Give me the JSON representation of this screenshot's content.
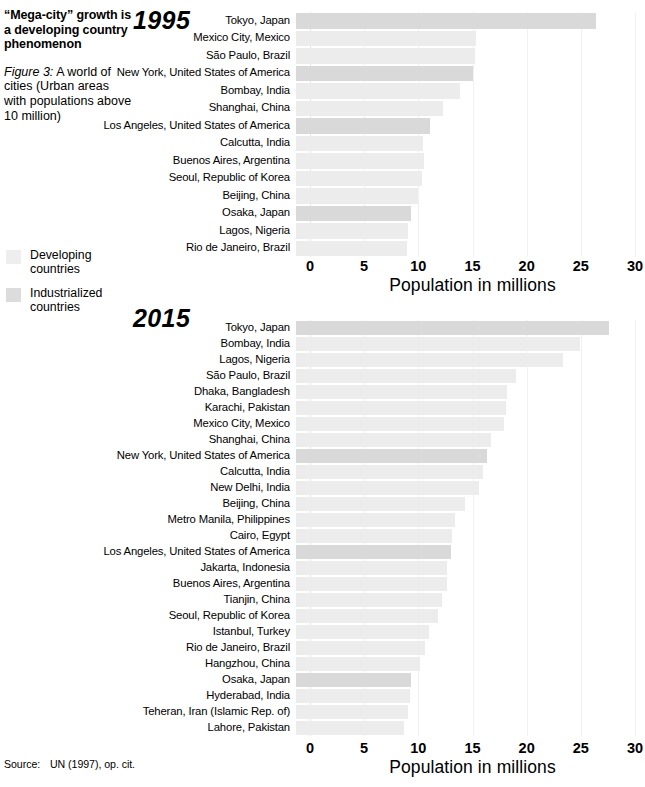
{
  "headline": "“Mega-city” growth is a developing country phenomenon",
  "caption": {
    "figure": "Figure 3:",
    "text": "A world of cities (Urban areas with populations above 10 million)"
  },
  "legend": {
    "items": [
      {
        "label": "Developing countries",
        "key": "developing",
        "color": "#ececec"
      },
      {
        "label": "Industrialized countries",
        "key": "industrialized",
        "color": "#d9d9d9"
      }
    ]
  },
  "source": {
    "label": "Source:",
    "text": "UN (1997), op. cit."
  },
  "axis": {
    "title": "Population in millions",
    "ticks": [
      "0",
      "5",
      "10",
      "15",
      "20",
      "25",
      "30"
    ],
    "min": 0,
    "max": 30
  },
  "chart_data": [
    {
      "type": "bar",
      "orientation": "horizontal",
      "title": "1995",
      "xlabel": "Population in millions",
      "ylabel": "",
      "xlim": [
        0,
        30
      ],
      "xticks": [
        0,
        5,
        10,
        15,
        20,
        25,
        30
      ],
      "grid": true,
      "legend_position": "left-panel",
      "categories": [
        "Tokyo, Japan",
        "Mexico City, Mexico",
        "São Paulo, Brazil",
        "New York, United States of America",
        "Bombay, India",
        "Shanghai, China",
        "Los Angeles, United States of America",
        "Calcutta, India",
        "Buenos Aires, Argentina",
        "Seoul, Republic of Korea",
        "Beijing, China",
        "Osaka, Japan",
        "Lagos, Nigeria",
        "Rio de Janeiro, Brazil"
      ],
      "values": [
        27.7,
        16.6,
        16.5,
        16.3,
        15.1,
        13.6,
        12.4,
        11.7,
        11.8,
        11.6,
        11.3,
        10.6,
        10.3,
        10.2
      ],
      "groups": [
        "industrialized",
        "developing",
        "developing",
        "industrialized",
        "developing",
        "developing",
        "industrialized",
        "developing",
        "developing",
        "developing",
        "developing",
        "industrialized",
        "developing",
        "developing"
      ]
    },
    {
      "type": "bar",
      "orientation": "horizontal",
      "title": "2015",
      "xlabel": "Population in millions",
      "ylabel": "",
      "xlim": [
        0,
        30
      ],
      "xticks": [
        0,
        5,
        10,
        15,
        20,
        25,
        30
      ],
      "grid": true,
      "legend_position": "left-panel",
      "categories": [
        "Tokyo, Japan",
        "Bombay, India",
        "Lagos, Nigeria",
        "São Paulo, Brazil",
        "Dhaka, Bangladesh",
        "Karachi, Pakistan",
        "Mexico City, Mexico",
        "Shanghai, China",
        "New York, United States of America",
        "Calcutta, India",
        "New Delhi, India",
        "Beijing, China",
        "Metro Manila, Philippines",
        "Cairo, Egypt",
        "Los Angeles, United States of America",
        "Jakarta, Indonesia",
        "Buenos Aires, Argentina",
        "Tianjin, China",
        "Seoul, Republic of Korea",
        "Istanbul, Turkey",
        "Rio de Janeiro, Brazil",
        "Hangzhou, China",
        "Osaka, Japan",
        "Hyderabad, India",
        "Teheran, Iran (Islamic Rep. of)",
        "Lahore, Pakistan"
      ],
      "values": [
        28.9,
        26.2,
        24.6,
        20.3,
        19.5,
        19.4,
        19.2,
        18.0,
        17.6,
        17.3,
        16.9,
        15.6,
        14.7,
        14.4,
        14.3,
        13.9,
        13.9,
        13.5,
        13.1,
        12.3,
        11.9,
        11.4,
        10.6,
        10.5,
        10.3,
        10.0
      ],
      "groups": [
        "industrialized",
        "developing",
        "developing",
        "developing",
        "developing",
        "developing",
        "developing",
        "developing",
        "industrialized",
        "developing",
        "developing",
        "developing",
        "developing",
        "developing",
        "industrialized",
        "developing",
        "developing",
        "developing",
        "developing",
        "developing",
        "developing",
        "developing",
        "industrialized",
        "developing",
        "developing",
        "developing"
      ]
    }
  ]
}
